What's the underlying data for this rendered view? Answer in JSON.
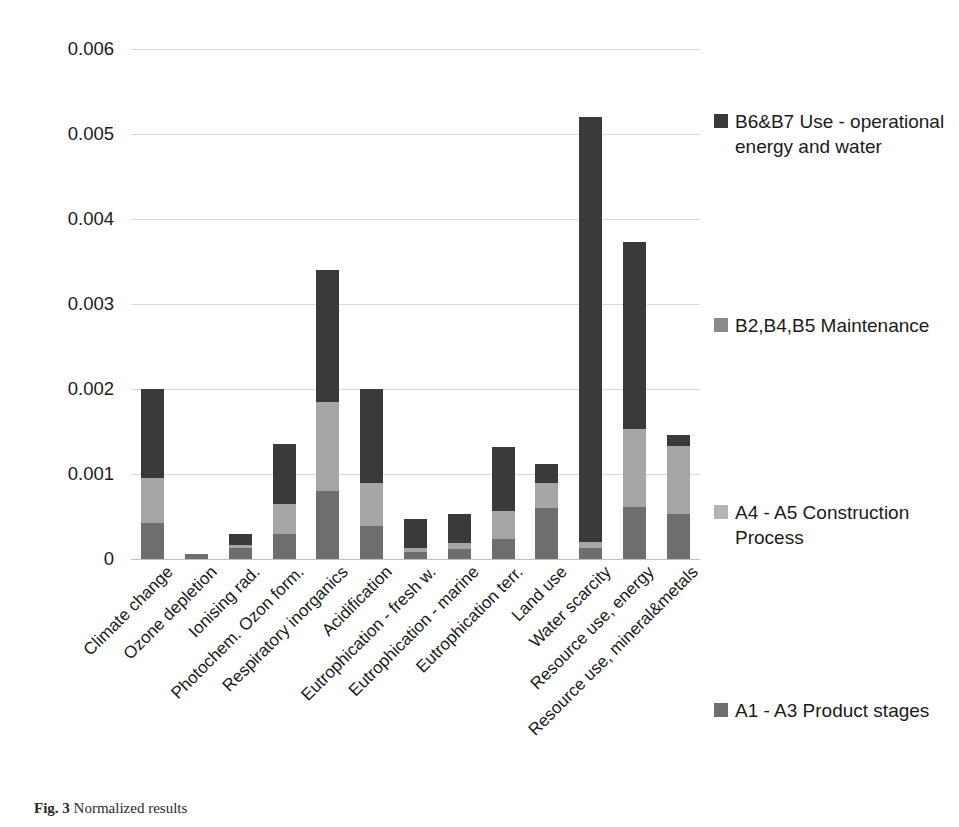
{
  "chart_data": {
    "type": "bar",
    "subtype": "stacked-vertical",
    "title": "",
    "xlabel": "",
    "ylabel": "",
    "ylim": [
      0,
      0.006
    ],
    "grid": true,
    "legend_position": "right",
    "y_ticks": [
      "0",
      "0.001",
      "0.002",
      "0.003",
      "0.004",
      "0.005",
      "0.006"
    ],
    "y_tick_values": [
      0,
      0.001,
      0.002,
      0.003,
      0.004,
      0.005,
      0.006
    ],
    "categories": [
      "Climate change",
      "Ozone depletion",
      "Ionising rad.",
      "Photochem. Ozon form.",
      "Respiratory inorganics",
      "Acidification",
      "Eutrophication - fresh w.",
      "Eutrophication - marine",
      "Eutrophication terr.",
      "Land use",
      "Water scarcity",
      "Resource use, energy",
      "Resource use, mineral&metals"
    ],
    "series": [
      {
        "name": "A1 - A3 Product stages",
        "color": "#6e6e6e",
        "values": [
          0.00042,
          6e-05,
          0.00013,
          0.0003,
          0.0008,
          0.00039,
          8e-05,
          0.00012,
          0.00024,
          0.0006,
          0.00013,
          0.00061,
          0.00053
        ]
      },
      {
        "name": "A4 - A5 Construction Process",
        "color": "#a6a6a6",
        "values": [
          0.00053,
          0.0,
          3e-05,
          0.00035,
          0.00105,
          0.0005,
          5e-05,
          7e-05,
          0.00032,
          0.0003,
          7e-05,
          0.00092,
          0.0008
        ]
      },
      {
        "name": "B2,B4,B5 Maintenance",
        "color": "#6e6e6e",
        "values": [
          0.0,
          0.0,
          0.0,
          0.0,
          0.0,
          0.0,
          0.0,
          0.0,
          0.0,
          0.0,
          0.0,
          0.0,
          0.0
        ]
      },
      {
        "name": "B6&B7 Use - operational energy and water",
        "color": "#3a3a3a",
        "values": [
          0.00105,
          0.0,
          0.00013,
          0.0007,
          0.00155,
          0.00111,
          0.00034,
          0.00034,
          0.00076,
          0.00022,
          0.005,
          0.0022,
          0.00013
        ]
      }
    ],
    "totals": [
      0.002,
      6e-05,
      0.00029,
      0.00135,
      0.0034,
      0.002,
      0.00047,
      0.00053,
      0.00132,
      0.00112,
      0.0052,
      0.00373,
      0.00146
    ]
  },
  "legend": {
    "items": [
      {
        "label": "B6&B7 Use - operational energy and water",
        "color": "#3a3a3a",
        "top": 61
      },
      {
        "label": "B2,B4,B5 Maintenance",
        "color": "#8a8a8a",
        "top": 265
      },
      {
        "label": "A4 - A5 Construction Process",
        "color": "#b3b3b3",
        "top": 452
      },
      {
        "label": "A1 - A3 Product stages",
        "color": "#6e6e6e",
        "top": 650
      }
    ]
  },
  "caption": {
    "prefix": "Fig. 3",
    "text": "Normalized results"
  }
}
